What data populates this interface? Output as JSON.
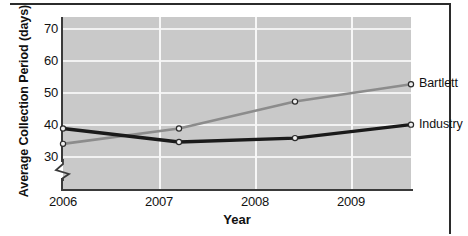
{
  "chart_data": {
    "type": "line",
    "title": "",
    "xlabel": "Year",
    "ylabel": "Average Collection Period (days)",
    "categories": [
      "2006",
      "2007",
      "2008",
      "2009"
    ],
    "x": [
      2006,
      2007,
      2008,
      2009
    ],
    "series": [
      {
        "name": "Bartlett",
        "values": [
          42,
          46,
          53,
          57.5
        ],
        "color": "#8c8c8c",
        "marker": "open-circle"
      },
      {
        "name": "Industry",
        "values": [
          46,
          42.5,
          43.5,
          47
        ],
        "color": "#1a1a1a",
        "marker": "open-circle"
      }
    ],
    "ylim": [
      30,
      75
    ],
    "xlim": [
      2006,
      2009
    ],
    "yticks": [
      30,
      40,
      50,
      60,
      70
    ],
    "ytick_labels": [
      "30",
      "40",
      "50",
      "60",
      "70"
    ],
    "xtick_labels": [
      "2006",
      "2007",
      "2008",
      "2009"
    ],
    "grid": true,
    "grid_color": "#f2f2f2",
    "axis_break": true,
    "axis_break_below": 30,
    "legend": "inline-end-labels",
    "plot_background": "#c9c9c9",
    "figure_background": "#ffffff"
  },
  "axes": {
    "y_title": "Average Collection Period (days)",
    "x_title": "Year",
    "y_tick_labels": [
      "70",
      "60",
      "50",
      "40",
      "30"
    ],
    "x_tick_labels": [
      "2006",
      "2007",
      "2008",
      "2009"
    ]
  },
  "labels": {
    "bartlett": "Bartlett",
    "industry": "Industry"
  },
  "colors": {
    "bartlett_line": "#8c8c8c",
    "industry_line": "#1a1a1a",
    "plot_bg": "#c9c9c9",
    "gridline": "#f2f2f2",
    "axis": "#3a3a3a",
    "frame": "#2b2b2b",
    "text": "#111111"
  }
}
